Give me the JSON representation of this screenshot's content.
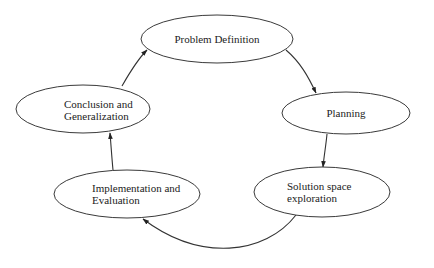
{
  "diagram": {
    "type": "cycle",
    "nodes": [
      {
        "id": "problem",
        "lines": [
          "Problem Definition"
        ]
      },
      {
        "id": "planning",
        "lines": [
          "Planning"
        ]
      },
      {
        "id": "solution",
        "lines": [
          "Solution space",
          "exploration"
        ]
      },
      {
        "id": "implementation",
        "lines": [
          "Implementation and",
          "Evaluation"
        ]
      },
      {
        "id": "conclusion",
        "lines": [
          "Conclusion and",
          "Generalization"
        ]
      }
    ],
    "edges": [
      {
        "from": "problem",
        "to": "planning"
      },
      {
        "from": "planning",
        "to": "solution"
      },
      {
        "from": "solution",
        "to": "implementation"
      },
      {
        "from": "implementation",
        "to": "conclusion"
      },
      {
        "from": "conclusion",
        "to": "problem"
      }
    ]
  },
  "colors": {
    "stroke": "#3a3a3a",
    "text": "#222222",
    "background": "#ffffff"
  }
}
